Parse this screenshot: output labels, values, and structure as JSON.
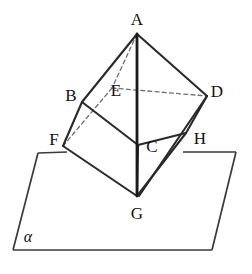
{
  "figure": {
    "type": "solid-geometry-diagram",
    "width": 252,
    "height": 274,
    "background_color": "#ffffff",
    "line_color": "#2a2a2a",
    "hidden_line_color": "#6f6f6f",
    "plane_line_color": "#3a3a3a"
  },
  "vertices": [
    {
      "id": "A",
      "label": "A",
      "x": 137,
      "y": 34,
      "label_x": 137,
      "label_y": 19,
      "hidden": false
    },
    {
      "id": "B",
      "label": "B",
      "x": 82,
      "y": 102,
      "label_x": 71,
      "label_y": 95,
      "hidden": false
    },
    {
      "id": "E",
      "label": "E",
      "x": 112,
      "y": 88,
      "label_x": 116,
      "label_y": 90,
      "hidden": true
    },
    {
      "id": "D",
      "label": "D",
      "x": 207,
      "y": 96,
      "label_x": 217,
      "label_y": 91,
      "hidden": false
    },
    {
      "id": "F",
      "label": "F",
      "x": 63,
      "y": 146,
      "label_x": 54,
      "label_y": 139,
      "hidden": false
    },
    {
      "id": "C",
      "label": "C",
      "x": 138,
      "y": 145,
      "label_x": 152,
      "label_y": 146,
      "hidden": false
    },
    {
      "id": "H",
      "label": "H",
      "x": 186,
      "y": 133,
      "label_x": 200,
      "label_y": 138,
      "hidden": false
    },
    {
      "id": "G",
      "label": "G",
      "x": 137,
      "y": 196,
      "label_x": 137,
      "label_y": 213,
      "hidden": false
    }
  ],
  "edges_solid": [
    {
      "name": "edge-A-B",
      "from": "A",
      "to": "B",
      "x1": 137,
      "y1": 34,
      "x2": 82,
      "y2": 102
    },
    {
      "name": "edge-A-D",
      "from": "A",
      "to": "D",
      "x1": 137,
      "y1": 34,
      "x2": 207,
      "y2": 96
    },
    {
      "name": "edge-B-F",
      "from": "B",
      "to": "F",
      "x1": 82,
      "y1": 102,
      "x2": 63,
      "y2": 146
    },
    {
      "name": "edge-B-C",
      "from": "B",
      "to": "C",
      "x1": 82,
      "y1": 102,
      "x2": 138,
      "y2": 145
    },
    {
      "name": "edge-D-H",
      "from": "D",
      "to": "H",
      "x1": 207,
      "y1": 96,
      "x2": 186,
      "y2": 133
    },
    {
      "name": "edge-C-H",
      "from": "C",
      "to": "H",
      "x1": 138,
      "y1": 145,
      "x2": 186,
      "y2": 133
    },
    {
      "name": "edge-F-G",
      "from": "F",
      "to": "G",
      "x1": 63,
      "y1": 146,
      "x2": 137,
      "y2": 196
    },
    {
      "name": "edge-C-G",
      "from": "C",
      "to": "G",
      "x1": 138,
      "y1": 145,
      "x2": 137,
      "y2": 196
    },
    {
      "name": "edge-H-G",
      "from": "H",
      "to": "G",
      "x1": 186,
      "y1": 133,
      "x2": 137,
      "y2": 196
    },
    {
      "name": "edge-D-G",
      "from": "D",
      "to": "G",
      "x1": 207,
      "y1": 96,
      "x2": 139,
      "y2": 196
    }
  ],
  "edges_axis": [
    {
      "name": "edge-A-G-vertical",
      "from": "A",
      "to": "G",
      "x1": 137,
      "y1": 34,
      "x2": 137,
      "y2": 196
    }
  ],
  "edges_dashed": [
    {
      "name": "edge-A-E-hidden",
      "from": "A",
      "to": "E",
      "x1": 137,
      "y1": 34,
      "x2": 112,
      "y2": 88
    },
    {
      "name": "edge-E-D-hidden",
      "from": "E",
      "to": "D",
      "x1": 112,
      "y1": 88,
      "x2": 207,
      "y2": 96
    },
    {
      "name": "edge-E-F-hidden",
      "from": "E",
      "to": "F",
      "x1": 112,
      "y1": 88,
      "x2": 63,
      "y2": 146
    }
  ],
  "plane": {
    "name": "plane-alpha",
    "label": "α",
    "label_x": 28,
    "label_y": 237,
    "corner_top_left": {
      "x": 38,
      "y": 153
    },
    "corner_top_right": {
      "x": 236,
      "y": 152
    },
    "corner_bottom_right": {
      "x": 212,
      "y": 250
    },
    "corner_bottom_left": {
      "x": 13,
      "y": 250
    },
    "top_edge_left_segment": {
      "x1": 38,
      "y1": 153,
      "x2": 67,
      "y2": 152
    },
    "top_edge_right_segment": {
      "x1": 183,
      "y1": 152,
      "x2": 236,
      "y2": 152
    },
    "left_edge": {
      "x1": 38,
      "y1": 153,
      "x2": 13,
      "y2": 250
    },
    "right_edge": {
      "x1": 236,
      "y1": 152,
      "x2": 212,
      "y2": 250
    },
    "bottom_edge": {
      "x1": 13,
      "y1": 250,
      "x2": 212,
      "y2": 250
    }
  }
}
